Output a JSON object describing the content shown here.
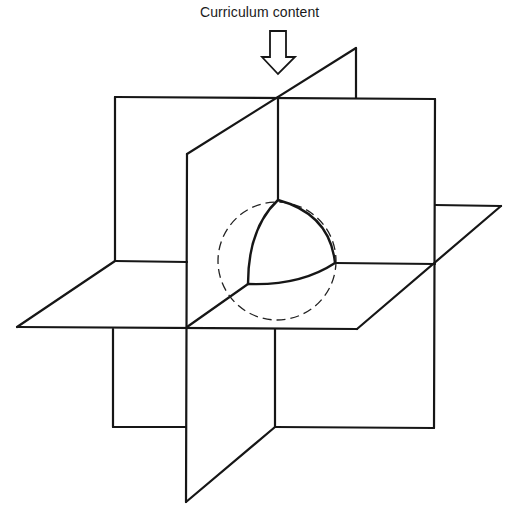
{
  "diagram": {
    "label": "Curriculum content",
    "arrow": {
      "direction": "down",
      "meaning": "curriculum-content-input"
    },
    "colors": {
      "line": "#161616",
      "background": "#ffffff"
    },
    "planes": [
      {
        "name": "vertical-back-plane",
        "points": [
          [
            115,
            97
          ],
          [
            435,
            99
          ],
          [
            434,
            428
          ],
          [
            113,
            427
          ]
        ]
      },
      {
        "name": "horizontal-plane",
        "points": [
          [
            17,
            327
          ],
          [
            115,
            261
          ],
          [
            501,
            206
          ],
          [
            357,
            329
          ]
        ]
      },
      {
        "name": "vertical-diagonal-plane",
        "points": [
          [
            187,
            154
          ],
          [
            356,
            48
          ],
          [
            356,
            98
          ],
          [
            275,
            427
          ],
          [
            186,
            502
          ]
        ]
      }
    ],
    "sphere": {
      "center": [
        277,
        261
      ],
      "radius": 59,
      "outline": "dashed",
      "octant": "solid"
    }
  }
}
